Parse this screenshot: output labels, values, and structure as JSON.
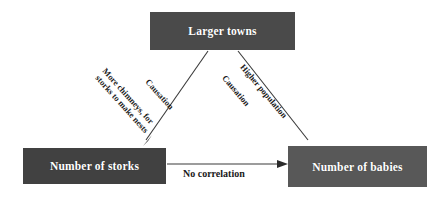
{
  "diagram": {
    "background_color": "#ffffff",
    "nodes": [
      {
        "id": "larger-towns",
        "label": "Larger towns",
        "color": "#4a4a4a",
        "text_color": "#ffffff"
      },
      {
        "id": "number-of-storks",
        "label": "Number of storks",
        "color": "#414141",
        "text_color": "#ffffff"
      },
      {
        "id": "number-of-babies",
        "label": "Number of babies",
        "color": "#585858",
        "text_color": "#ffffff"
      }
    ],
    "edges": [
      {
        "id": "towns-to-storks",
        "from": "larger-towns",
        "to": "number-of-storks",
        "reason_line_1": "More chimneys, for",
        "reason_line_2": "storks to make nests",
        "relation": "Causation",
        "color": "#3a3a3a"
      },
      {
        "id": "towns-to-babies",
        "from": "larger-towns",
        "to": "number-of-babies",
        "reason_line_1": "Higher population",
        "relation": "Causation",
        "color": "#3a3a3a"
      },
      {
        "id": "storks-to-babies",
        "from": "number-of-storks",
        "to": "number-of-babies",
        "relation": "No correlation",
        "color": "#3a3a3a"
      }
    ]
  }
}
